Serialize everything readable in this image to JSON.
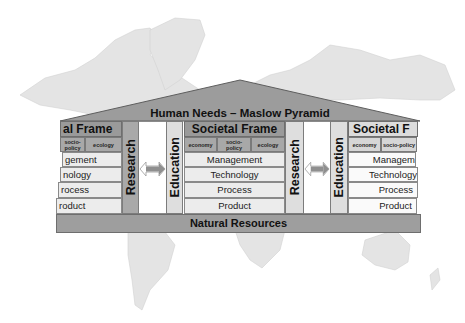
{
  "diagram": {
    "roof": {
      "label": "Human Needs – Maslow Pyramid"
    },
    "base": {
      "label": "Natural Resources"
    },
    "frames": [
      {
        "title": "al Frame",
        "subs": [
          "socio-policy",
          "ecology"
        ],
        "rows": [
          "gement",
          "nology",
          "rocess",
          "roduct"
        ]
      },
      {
        "title": "Societal Frame",
        "subs": [
          "economy",
          "socio-policy",
          "ecology"
        ],
        "rows": [
          "Management",
          "Technology",
          "Process",
          "Product"
        ]
      },
      {
        "title": "Societal F",
        "subs": [
          "economy",
          "socio-policy"
        ],
        "rows": [
          "Managem",
          "Technology",
          "Process",
          "Product"
        ]
      }
    ],
    "pillars": [
      {
        "label": "Research"
      },
      {
        "label": "Education"
      },
      {
        "label": "Research"
      },
      {
        "label": "Education"
      }
    ],
    "connectors": [
      {
        "icon": "double-arrow-icon"
      },
      {
        "icon": "double-arrow-icon"
      }
    ],
    "colors": {
      "roof": "#9c9c9c",
      "frame_title": "#9a9a9a",
      "pillar_dark": "#a9a9a9",
      "row": "#ececec",
      "map": "#e2e2e2"
    },
    "background": {
      "icon": "world-map-icon"
    }
  }
}
